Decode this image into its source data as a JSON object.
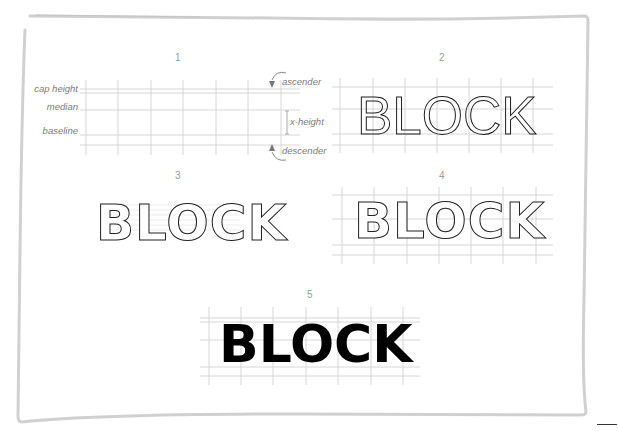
{
  "figure": {
    "panels": [
      {
        "number": "1",
        "word": ""
      },
      {
        "number": "2",
        "word": "BLOCK"
      },
      {
        "number": "3",
        "word": "BLOCK"
      },
      {
        "number": "4",
        "word": "BLOCK"
      },
      {
        "number": "5",
        "word": "BLOCK"
      }
    ],
    "guide_labels": {
      "cap_height": "cap height",
      "median": "median",
      "baseline": "baseline",
      "ascender": "ascender",
      "x_height": "x-height",
      "descender": "descender"
    },
    "colors": {
      "frame": "#cfcfcf",
      "grid": "#d4d4d4",
      "label": "#7a7a7a",
      "ink": "#111111"
    }
  }
}
